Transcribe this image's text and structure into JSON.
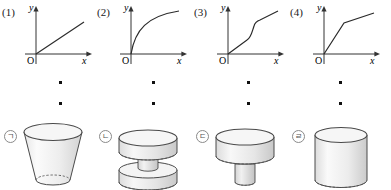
{
  "graphs": [
    {
      "number": "(1)",
      "y_label": "y",
      "x_label": "x",
      "origin_label": "O",
      "shape": "straight-line-through-origin",
      "description": "linear increasing line from origin, constant slope"
    },
    {
      "number": "(2)",
      "y_label": "y",
      "x_label": "x",
      "origin_label": "O",
      "shape": "concave-down-increasing-curve",
      "description": "square-root like curve, rises steeply then flattens"
    },
    {
      "number": "(3)",
      "y_label": "y",
      "x_label": "x",
      "origin_label": "O",
      "shape": "shallow-steep-shallow-piecewise",
      "description": "gentle slope, then steep rise, then gentle slope again"
    },
    {
      "number": "(4)",
      "y_label": "y",
      "x_label": "x",
      "origin_label": "O",
      "shape": "steep-then-shallow-piecewise",
      "description": "steep rise then shallower rise"
    }
  ],
  "vessels": [
    {
      "tag": "ㄱ",
      "name": "inverted-truncated-cone",
      "description": "frustum, wide circular top narrowing toward the bottom"
    },
    {
      "tag": "ㄴ",
      "name": "two-wide-cylinders-with-narrow-neck",
      "description": "wide cylinder at top, narrow cylindrical neck, wide cylinder at bottom"
    },
    {
      "tag": "ㄷ",
      "name": "wide-cylinder-over-narrow-cylinder",
      "description": "wide cylinder on top of a narrow cylindrical base"
    },
    {
      "tag": "ㄹ",
      "name": "plain-cylinder",
      "description": "single uniform cylinder"
    }
  ],
  "separator_dots": {
    "columns": [
      60,
      153,
      248,
      340
    ],
    "rows": [
      82,
      103
    ],
    "count_per_column": 2,
    "color": "#111111"
  },
  "colors": {
    "stroke": "#3f3f3f",
    "fill_light": "#f2f2f2",
    "fill_mid": "#dedede",
    "fill_dark": "#cfcfcf",
    "axis": "#333333",
    "tag_border": "#8a8a8a"
  }
}
